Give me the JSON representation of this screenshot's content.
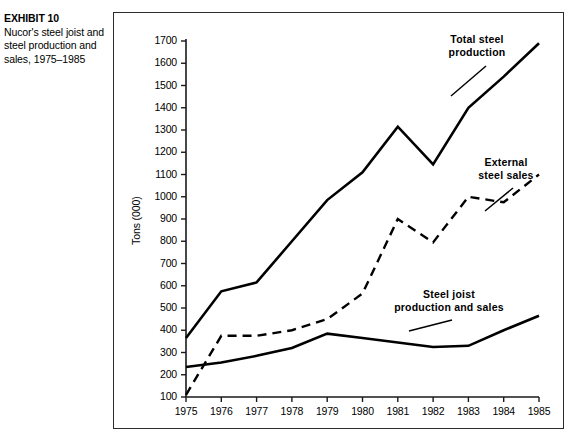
{
  "caption": {
    "exhibit_label": "EXHIBIT 10",
    "description": "Nucor's steel joist and steel production and sales, 1975–1985"
  },
  "chart_data": {
    "type": "line",
    "title": "",
    "xlabel": "",
    "ylabel": "Tons (000)",
    "x": [
      1975,
      1976,
      1977,
      1978,
      1979,
      1980,
      1981,
      1982,
      1983,
      1984,
      1985
    ],
    "categories": [
      "1975",
      "1976",
      "1977",
      "1978",
      "1979",
      "1980",
      "1981",
      "1982",
      "1983",
      "1984",
      "1985"
    ],
    "xlim": [
      1975,
      1985
    ],
    "ylim": [
      100,
      1700
    ],
    "ytick_labels": [
      "1700",
      "1600",
      "1500",
      "1400",
      "1300",
      "1200",
      "1100",
      "1000",
      "900",
      "800",
      "700",
      "600",
      "500",
      "400",
      "300",
      "200",
      "100"
    ],
    "ytick_values": [
      1700,
      1600,
      1500,
      1400,
      1300,
      1200,
      1100,
      1000,
      900,
      800,
      700,
      600,
      500,
      400,
      300,
      200,
      100
    ],
    "grid": false,
    "legend_position": "inline-annotations",
    "series": [
      {
        "name": "Total steel production",
        "style": "solid",
        "color": "#000000",
        "values": [
          365,
          575,
          615,
          800,
          985,
          1110,
          1315,
          1145,
          1400,
          1540,
          1690
        ]
      },
      {
        "name": "External steel sales",
        "style": "dashed",
        "color": "#000000",
        "values": [
          110,
          375,
          375,
          400,
          450,
          565,
          900,
          795,
          1000,
          975,
          1100
        ]
      },
      {
        "name": "Steel joist production and sales",
        "style": "solid",
        "color": "#000000",
        "values": [
          235,
          255,
          285,
          320,
          385,
          365,
          345,
          325,
          330,
          400,
          465
        ]
      }
    ],
    "annotations": [
      {
        "text_line1": "Total steel",
        "text_line2": "production"
      },
      {
        "text_line1": "External",
        "text_line2": "steel sales"
      },
      {
        "text_line1": "Steel joist",
        "text_line2": "production and sales"
      }
    ]
  }
}
